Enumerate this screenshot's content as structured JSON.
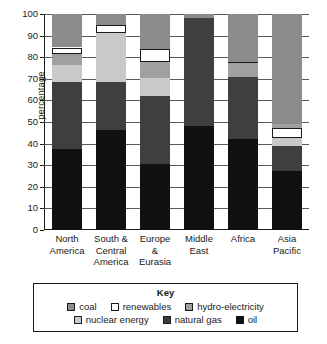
{
  "chart_data": {
    "type": "bar",
    "subtype": "stacked-bar-100",
    "title": "",
    "xlabel": "",
    "ylabel": "percentage",
    "ylim": [
      0,
      100
    ],
    "yticks": [
      0,
      10,
      20,
      30,
      40,
      50,
      60,
      70,
      80,
      90,
      100
    ],
    "ytick_labels": [
      "0",
      "10",
      "20",
      "30",
      "40",
      "50",
      "60",
      "70",
      "80",
      "90",
      "100"
    ],
    "grid": true,
    "legend_position": "bottom",
    "legend_title": "Key",
    "categories": [
      "North America",
      "South & Central America",
      "Europe & Eurasia",
      "Middle East",
      "Africa",
      "Asia Pacific"
    ],
    "category_lines": [
      [
        "North",
        "America"
      ],
      [
        "South &",
        "Central",
        "America"
      ],
      [
        "Europe",
        "&",
        "Eurasia"
      ],
      [
        "Middle",
        "East"
      ],
      [
        "Africa"
      ],
      [
        "Asia",
        "Pacific"
      ]
    ],
    "series": [
      {
        "name": "oil",
        "color": "#111111",
        "values": [
          37.5,
          46.5,
          30.5,
          48.0,
          42.0,
          27.5
        ]
      },
      {
        "name": "natural gas",
        "color": "#3f3f3f",
        "values": [
          31.0,
          22.0,
          31.5,
          50.0,
          29.0,
          11.5
        ]
      },
      {
        "name": "nuclear energy",
        "color": "#c9c9c9",
        "values": [
          8.0,
          22.5,
          8.5,
          0.0,
          0.0,
          3.5
        ]
      },
      {
        "name": "hydro-electricity",
        "color": "#a0a0a0",
        "values": [
          5.0,
          0.0,
          7.5,
          0.0,
          6.5,
          2.0
        ]
      },
      {
        "name": "renewables",
        "color": "#ffffff",
        "values": [
          3.0,
          4.0,
          6.0,
          0.0,
          0.5,
          4.5
        ]
      },
      {
        "name": "coal",
        "color": "#8c8c8c",
        "values": [
          15.5,
          5.0,
          16.0,
          2.0,
          22.0,
          51.0
        ]
      }
    ],
    "stack_order_bottom_to_top": [
      "oil",
      "natural gas",
      "nuclear energy",
      "hydro-electricity",
      "renewables",
      "coal"
    ],
    "stacks": [
      {
        "category": "North America",
        "segments": [
          {
            "name": "oil",
            "start": 0,
            "end": 37.5
          },
          {
            "name": "natural gas",
            "start": 37.5,
            "end": 68.5
          },
          {
            "name": "nuclear energy",
            "start": 68.5,
            "end": 76.5
          },
          {
            "name": "hydro-electricity",
            "start": 76.5,
            "end": 81.5
          },
          {
            "name": "renewables",
            "start": 81.5,
            "end": 84.5
          },
          {
            "name": "coal",
            "start": 84.5,
            "end": 100
          }
        ]
      },
      {
        "category": "South & Central America",
        "segments": [
          {
            "name": "oil",
            "start": 0,
            "end": 46.5
          },
          {
            "name": "natural gas",
            "start": 46.5,
            "end": 68.5
          },
          {
            "name": "nuclear energy",
            "start": 68.5,
            "end": 91
          },
          {
            "name": "renewables",
            "start": 91,
            "end": 95
          },
          {
            "name": "coal",
            "start": 95,
            "end": 100
          }
        ]
      },
      {
        "category": "Europe & Eurasia",
        "segments": [
          {
            "name": "oil",
            "start": 0,
            "end": 30.5
          },
          {
            "name": "natural gas",
            "start": 30.5,
            "end": 62
          },
          {
            "name": "nuclear energy",
            "start": 62,
            "end": 70.5
          },
          {
            "name": "hydro-electricity",
            "start": 70.5,
            "end": 78
          },
          {
            "name": "renewables",
            "start": 78,
            "end": 84
          },
          {
            "name": "coal",
            "start": 84,
            "end": 100
          }
        ]
      },
      {
        "category": "Middle East",
        "segments": [
          {
            "name": "oil",
            "start": 0,
            "end": 48
          },
          {
            "name": "natural gas",
            "start": 48,
            "end": 98
          },
          {
            "name": "coal",
            "start": 98,
            "end": 100
          }
        ]
      },
      {
        "category": "Africa",
        "segments": [
          {
            "name": "oil",
            "start": 0,
            "end": 42
          },
          {
            "name": "natural gas",
            "start": 42,
            "end": 71
          },
          {
            "name": "hydro-electricity",
            "start": 71,
            "end": 77.5
          },
          {
            "name": "renewables",
            "start": 77.5,
            "end": 78
          },
          {
            "name": "coal",
            "start": 78,
            "end": 100
          }
        ]
      },
      {
        "category": "Asia Pacific",
        "segments": [
          {
            "name": "oil",
            "start": 0,
            "end": 27.5
          },
          {
            "name": "natural gas",
            "start": 27.5,
            "end": 39
          },
          {
            "name": "nuclear energy",
            "start": 39,
            "end": 42.5
          },
          {
            "name": "renewables",
            "start": 42.5,
            "end": 47
          },
          {
            "name": "hydro-electricity",
            "start": 47,
            "end": 49
          },
          {
            "name": "coal",
            "start": 49,
            "end": 100
          }
        ]
      }
    ]
  },
  "legend": {
    "title": "Key",
    "rows": [
      [
        {
          "label": "coal",
          "color": "#8c8c8c"
        },
        {
          "label": "renewables",
          "color": "#ffffff"
        },
        {
          "label": "hydro-electricity",
          "color": "#a0a0a0"
        }
      ],
      [
        {
          "label": "nuclear energy",
          "color": "#c9c9c9"
        },
        {
          "label": "natural gas",
          "color": "#3f3f3f"
        },
        {
          "label": "oil",
          "color": "#111111"
        }
      ]
    ]
  }
}
